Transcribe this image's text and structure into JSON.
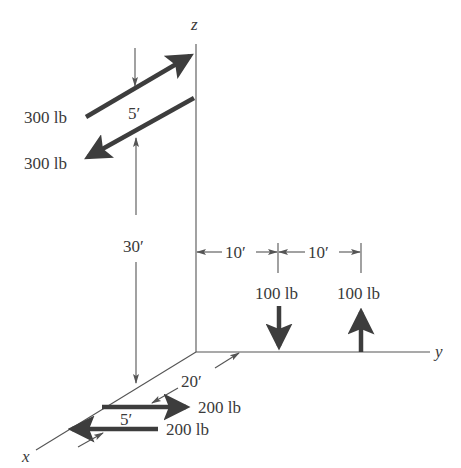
{
  "diagram": {
    "axes": {
      "x_label": "x",
      "y_label": "y",
      "z_label": "z"
    },
    "forces": {
      "upper_couple": {
        "top_force": "300 lb",
        "bottom_force": "300 lb",
        "spacing": "5′",
        "height": "30′"
      },
      "vertical_couple": {
        "left_force": "100 lb",
        "right_force": "100 lb",
        "distance_1": "10′",
        "distance_2": "10′"
      },
      "lower_couple": {
        "top_force": "200 lb",
        "bottom_force": "200 lb",
        "spacing": "5′",
        "distance_along_x": "20′"
      }
    },
    "colors": {
      "line": "#555555",
      "force_arrow": "#3d3d3d",
      "text": "#3a3a3a",
      "background": "#ffffff"
    }
  }
}
